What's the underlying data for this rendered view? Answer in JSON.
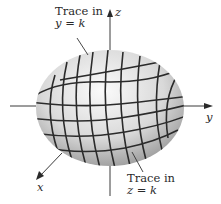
{
  "figure": {
    "axes": {
      "z": "z",
      "y": "y",
      "x": "x"
    },
    "annotations": [
      {
        "line1": "Trace in",
        "line2": "y = k"
      },
      {
        "line1": "Trace in",
        "line2": "z = k"
      }
    ],
    "colors": {
      "surface_light": "#f2f2f2",
      "surface_dark": "#8a8a8a",
      "trace": "#2b2b2b",
      "axis": "#3a3a3a"
    }
  }
}
